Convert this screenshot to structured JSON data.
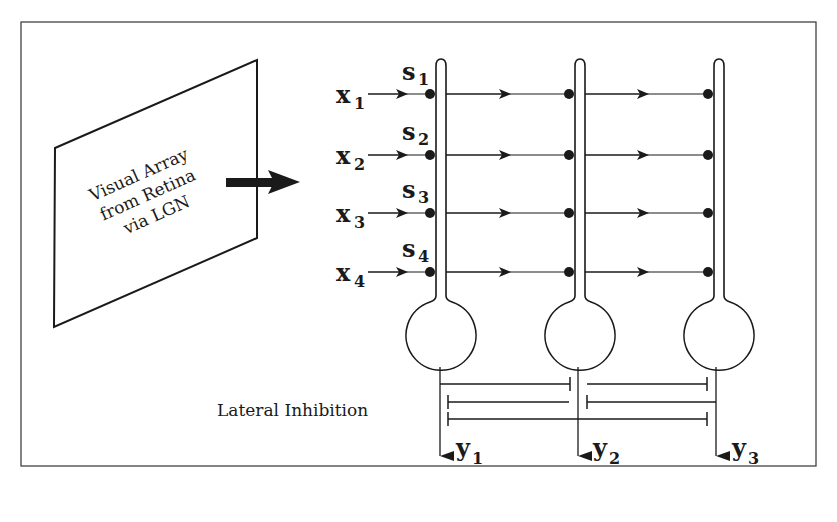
{
  "diagram": {
    "title": "",
    "retina_panel": {
      "label_lines": [
        "Visual Array",
        "from Retina",
        "via LGN"
      ]
    },
    "inputs": [
      {
        "name": "x",
        "sub": "1",
        "synapse": "s",
        "synapse_sub": "1"
      },
      {
        "name": "x",
        "sub": "2",
        "synapse": "s",
        "synapse_sub": "2"
      },
      {
        "name": "x",
        "sub": "3",
        "synapse": "s",
        "synapse_sub": "3"
      },
      {
        "name": "x",
        "sub": "4",
        "synapse": "s",
        "synapse_sub": "4"
      }
    ],
    "outputs": [
      {
        "name": "y",
        "sub": "1"
      },
      {
        "name": "y",
        "sub": "2"
      },
      {
        "name": "y",
        "sub": "3"
      }
    ],
    "neuron_count": 3,
    "lateral_label": "Lateral Inhibition",
    "colors": {
      "stroke": "#1a1a1a",
      "frame": "#333333",
      "background": "#ffffff"
    }
  }
}
